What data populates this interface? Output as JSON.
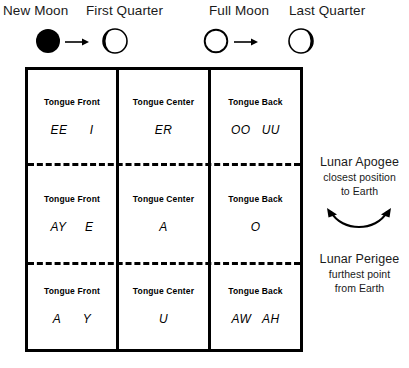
{
  "diagram": {
    "title_row": {
      "phases": [
        {
          "label": "New Moon",
          "icon": "new-moon-icon"
        },
        {
          "label": "First Quarter",
          "icon": "first-quarter-moon-icon"
        },
        {
          "label": "Full Moon",
          "icon": "full-moon-icon"
        },
        {
          "label": "Last Quarter",
          "icon": "last-quarter-moon-icon"
        }
      ],
      "arrows": [
        {
          "icon": "right-arrow-icon"
        },
        {
          "icon": "right-arrow-icon"
        }
      ]
    },
    "table": {
      "rows": [
        {
          "cells": [
            {
              "title": "Tongue Front",
              "vowels": "EE      I"
            },
            {
              "title": "Tongue Center",
              "vowels": "ER"
            },
            {
              "title": "Tongue Back",
              "vowels": "OO   UU"
            }
          ]
        },
        {
          "cells": [
            {
              "title": "Tongue Front",
              "vowels": "AY     E"
            },
            {
              "title": "Tongue Center",
              "vowels": "A"
            },
            {
              "title": "Tongue Back",
              "vowels": "O"
            }
          ]
        },
        {
          "cells": [
            {
              "title": "Tongue Front",
              "vowels": "A      Y"
            },
            {
              "title": "Tongue Center",
              "vowels": "U"
            },
            {
              "title": "Tongue Back",
              "vowels": "AW   AH"
            }
          ]
        }
      ]
    },
    "annotations": [
      {
        "title": "Lunar Apogee",
        "sub_line1": "closest position",
        "sub_line2": "to Earth"
      },
      {
        "title": "Lunar Perigee",
        "sub_line1": "furthest point",
        "sub_line2": "from Earth"
      }
    ],
    "curve_arrow": {
      "icon": "double-headed-curved-arrow-icon"
    },
    "colors": {
      "ink": "#000000",
      "text": "#1a1a1a",
      "background": "#ffffff"
    }
  }
}
